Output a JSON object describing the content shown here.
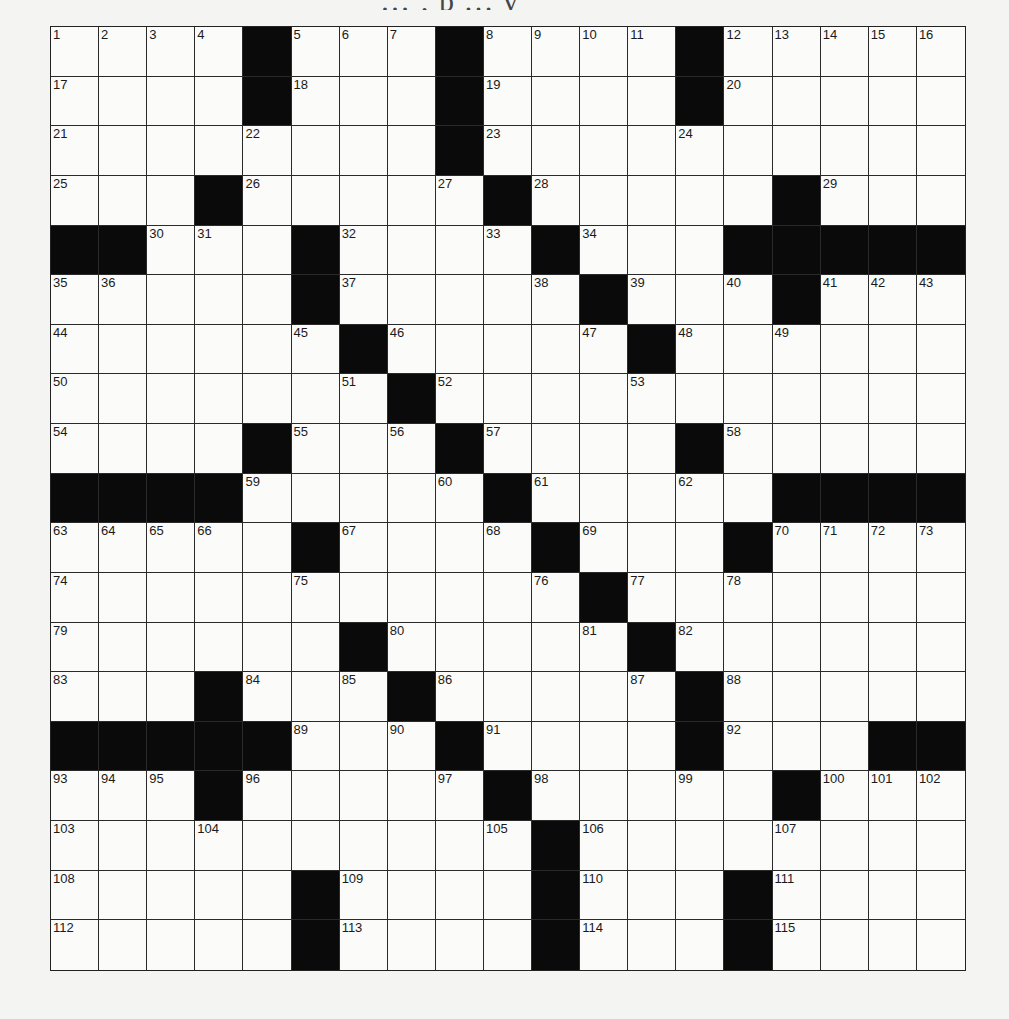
{
  "header": {
    "partial_text": "…  ‚  p  …  y"
  },
  "puzzle": {
    "rows": 19,
    "cols": 19,
    "colors": {
      "block": "#0a0a0a",
      "cell": "#fbfbfa",
      "line": "#2a2a2a"
    },
    "grid": [
      [
        "1",
        "2",
        "3",
        "4",
        "#",
        "5",
        "6",
        "7",
        "#",
        "8",
        "9",
        "10",
        "11",
        "#",
        "12",
        "13",
        "14",
        "15",
        "16"
      ],
      [
        "17",
        "",
        "",
        "",
        "#",
        "18",
        "",
        "",
        "#",
        "19",
        "",
        "",
        "",
        "#",
        "20",
        "",
        "",
        "",
        ""
      ],
      [
        "21",
        "",
        "",
        "",
        "22",
        "",
        "",
        "",
        "#",
        "23",
        "",
        "",
        "",
        "24",
        "",
        "",
        "",
        "",
        ""
      ],
      [
        "25",
        "",
        "",
        "#",
        "26",
        "",
        "",
        "",
        "27",
        "#",
        "28",
        "",
        "",
        "",
        "",
        "#",
        "29",
        "",
        ""
      ],
      [
        "#",
        "#",
        "30",
        "31",
        "",
        "#",
        "32",
        "",
        "",
        "33",
        "#",
        "34",
        "",
        "",
        "#",
        "#",
        "#",
        "#",
        "#"
      ],
      [
        "35",
        "36",
        "",
        "",
        "",
        "#",
        "37",
        "",
        "",
        "",
        "38",
        "#",
        "39",
        "",
        "40",
        "#",
        "41",
        "42",
        "43"
      ],
      [
        "44",
        "",
        "",
        "",
        "",
        "45",
        "#",
        "46",
        "",
        "",
        "",
        "47",
        "#",
        "48",
        "",
        "49",
        "",
        "",
        ""
      ],
      [
        "50",
        "",
        "",
        "",
        "",
        "",
        "51",
        "#",
        "52",
        "",
        "",
        "",
        "53",
        "",
        "",
        "",
        "",
        "",
        ""
      ],
      [
        "54",
        "",
        "",
        "",
        "#",
        "55",
        "",
        "56",
        "#",
        "57",
        "",
        "",
        "",
        "#",
        "58",
        "",
        "",
        "",
        ""
      ],
      [
        "#",
        "#",
        "#",
        "#",
        "59",
        "",
        "",
        "",
        "60",
        "#",
        "61",
        "",
        "",
        "62",
        "",
        "#",
        "#",
        "#",
        "#"
      ],
      [
        "63",
        "64",
        "65",
        "66",
        "",
        "#",
        "67",
        "",
        "",
        "68",
        "#",
        "69",
        "",
        "",
        "#",
        "70",
        "71",
        "72",
        "73"
      ],
      [
        "74",
        "",
        "",
        "",
        "",
        "75",
        "",
        "",
        "",
        "",
        "76",
        "#",
        "77",
        "",
        "78",
        "",
        "",
        "",
        ""
      ],
      [
        "79",
        "",
        "",
        "",
        "",
        "",
        "#",
        "80",
        "",
        "",
        "",
        "81",
        "#",
        "82",
        "",
        "",
        "",
        "",
        ""
      ],
      [
        "83",
        "",
        "",
        "#",
        "84",
        "",
        "85",
        "#",
        "86",
        "",
        "",
        "",
        "87",
        "#",
        "88",
        "",
        "",
        "",
        ""
      ],
      [
        "#",
        "#",
        "#",
        "#",
        "#",
        "89",
        "",
        "90",
        "#",
        "91",
        "",
        "",
        "",
        "#",
        "92",
        "",
        "",
        "#",
        "#"
      ],
      [
        "93",
        "94",
        "95",
        "#",
        "96",
        "",
        "",
        "",
        "97",
        "#",
        "98",
        "",
        "",
        "99",
        "",
        "#",
        "100",
        "101",
        "102"
      ],
      [
        "103",
        "",
        "",
        "104",
        "",
        "",
        "",
        "",
        "",
        "105",
        "#",
        "106",
        "",
        "",
        "",
        "107",
        "",
        "",
        ""
      ],
      [
        "108",
        "",
        "",
        "",
        "",
        "#",
        "109",
        "",
        "",
        "",
        "#",
        "110",
        "",
        "",
        "#",
        "111",
        "",
        "",
        ""
      ],
      [
        "112",
        "",
        "",
        "",
        "",
        "#",
        "113",
        "",
        "",
        "",
        "#",
        "114",
        "",
        "",
        "#",
        "115",
        "",
        "",
        ""
      ]
    ]
  }
}
